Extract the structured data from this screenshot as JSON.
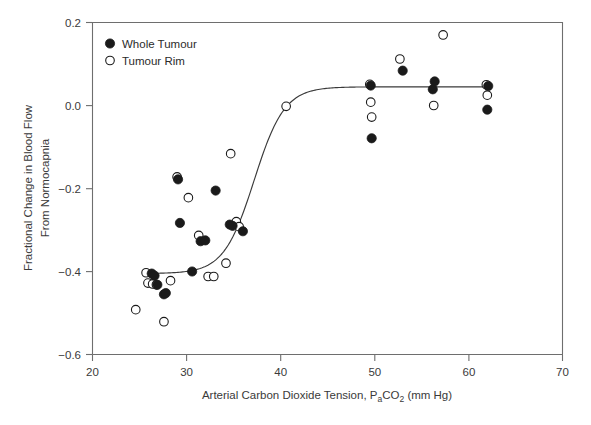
{
  "chart_data": {
    "type": "scatter",
    "title": "",
    "xlabel": "Arterial Carbon Dioxide Tension, PaCO2 (mm Hg)",
    "xlabel_parts": {
      "pre": "Arterial Carbon Dioxide Tension, P",
      "sub1": "a",
      "mid": "CO",
      "sub2": "2",
      "post": " (mm Hg)"
    },
    "ylabel_line1": "Fractional Change in Blood Flow",
    "ylabel_line2": "From Normocapnia",
    "xlim": [
      20,
      70
    ],
    "ylim": [
      -0.6,
      0.2
    ],
    "xticks": [
      20,
      30,
      40,
      50,
      60,
      70
    ],
    "xtick_labels": [
      "20",
      "30",
      "40",
      "50",
      "60",
      "70"
    ],
    "yticks": [
      -0.6,
      -0.4,
      -0.2,
      0.0,
      0.2
    ],
    "ytick_labels": [
      "−0.6",
      "−0.4",
      "−0.2",
      "0.0",
      "0.2"
    ],
    "grid": false,
    "legend_position": "top-left",
    "colors": {
      "filled": "#1a1a1a",
      "open_fill": "#ffffff",
      "open_stroke": "#1a1a1a",
      "axis": "#6e6e6e",
      "curve": "#3a3a3a"
    },
    "series": [
      {
        "name": "Whole Tumour",
        "marker": "filled-circle",
        "points": [
          [
            26.3,
            -0.405
          ],
          [
            26.6,
            -0.41
          ],
          [
            26.9,
            -0.432
          ],
          [
            27.6,
            -0.455
          ],
          [
            27.8,
            -0.452
          ],
          [
            29.1,
            -0.178
          ],
          [
            29.3,
            -0.283
          ],
          [
            31.5,
            -0.327
          ],
          [
            32.0,
            -0.325
          ],
          [
            30.6,
            -0.4
          ],
          [
            33.1,
            -0.205
          ],
          [
            34.6,
            -0.287
          ],
          [
            34.9,
            -0.29
          ],
          [
            36.0,
            -0.303
          ],
          [
            49.6,
            0.048
          ],
          [
            49.7,
            -0.079
          ],
          [
            53.0,
            0.084
          ],
          [
            56.2,
            0.039
          ],
          [
            56.4,
            0.058
          ],
          [
            62.0,
            -0.01
          ],
          [
            62.1,
            0.047
          ]
        ]
      },
      {
        "name": "Tumour Rim",
        "marker": "open-circle",
        "points": [
          [
            24.6,
            -0.492
          ],
          [
            25.7,
            -0.403
          ],
          [
            25.9,
            -0.428
          ],
          [
            26.4,
            -0.43
          ],
          [
            26.8,
            -0.432
          ],
          [
            27.6,
            -0.521
          ],
          [
            28.3,
            -0.422
          ],
          [
            29.0,
            -0.172
          ],
          [
            30.2,
            -0.222
          ],
          [
            31.3,
            -0.313
          ],
          [
            32.3,
            -0.412
          ],
          [
            32.9,
            -0.412
          ],
          [
            34.2,
            -0.38
          ],
          [
            34.7,
            -0.116
          ],
          [
            35.3,
            -0.28
          ],
          [
            35.6,
            -0.292
          ],
          [
            40.6,
            -0.002
          ],
          [
            49.5,
            0.051
          ],
          [
            49.6,
            0.008
          ],
          [
            49.7,
            -0.028
          ],
          [
            52.7,
            0.112
          ],
          [
            56.3,
            0.0
          ],
          [
            57.3,
            0.17
          ],
          [
            61.9,
            0.05
          ],
          [
            62.0,
            0.025
          ]
        ]
      }
    ],
    "fit_curve": {
      "description": "sigmoid fit",
      "bottom": -0.405,
      "top": 0.045,
      "ec50": 37.2,
      "hill_slope": 0.62,
      "x_start": 25.4,
      "x_end": 62.3
    }
  },
  "legend": {
    "items": [
      {
        "label": "Whole Tumour",
        "marker": "filled-circle"
      },
      {
        "label": "Tumour Rim",
        "marker": "open-circle"
      }
    ]
  }
}
